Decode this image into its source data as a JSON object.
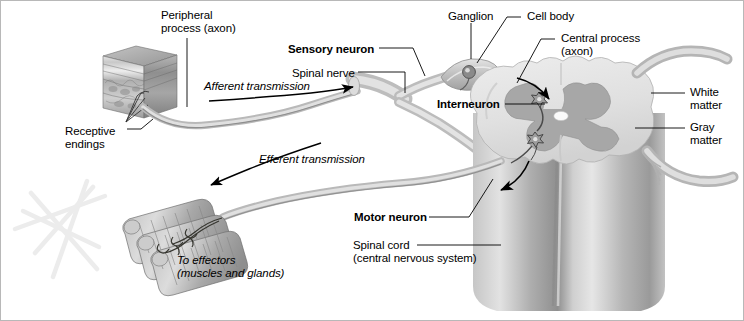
{
  "figure": {
    "background_color": "#ffffff",
    "border_color": "#b8b8b8",
    "width": 744,
    "height": 321
  },
  "palette": {
    "nerve_light": "#d8d8d8",
    "nerve_mid": "#b4b4b4",
    "nerve_dark": "#8f8f8f",
    "white_matter": "#e3e3e3",
    "gray_matter": "#a9a9a9",
    "cord_body_light": "#d4d4d4",
    "cord_body_dark": "#9b9b9b",
    "skin_block": "#9a9a9a",
    "muscle": "#a6a6a6",
    "line": "#000000",
    "watermark": "#ececec"
  },
  "labels": [
    {
      "id": "peripheral-process",
      "text": "Peripheral\nprocess (axon)",
      "bold": false,
      "italic": false,
      "x": 160,
      "y": 8,
      "align": "left"
    },
    {
      "id": "sensory-neuron",
      "text": "Sensory neuron",
      "bold": true,
      "italic": false,
      "x": 287,
      "y": 42,
      "align": "left"
    },
    {
      "id": "spinal-nerve",
      "text": "Spinal nerve",
      "bold": false,
      "italic": false,
      "x": 291,
      "y": 66,
      "align": "left"
    },
    {
      "id": "afferent-transmission",
      "text": "Afferent transmission",
      "bold": false,
      "italic": true,
      "x": 203,
      "y": 79,
      "align": "left"
    },
    {
      "id": "receptive-endings",
      "text": "Receptive\nendings",
      "bold": false,
      "italic": false,
      "x": 64,
      "y": 124,
      "align": "left"
    },
    {
      "id": "ganglion",
      "text": "Ganglion",
      "bold": false,
      "italic": false,
      "x": 447,
      "y": 9,
      "align": "left"
    },
    {
      "id": "cell-body",
      "text": "Cell body",
      "bold": false,
      "italic": false,
      "x": 526,
      "y": 9,
      "align": "left"
    },
    {
      "id": "central-process",
      "text": "Central process\n(axon)",
      "bold": false,
      "italic": false,
      "x": 560,
      "y": 31,
      "align": "left"
    },
    {
      "id": "interneuron",
      "text": "Interneuron",
      "bold": true,
      "italic": false,
      "x": 436,
      "y": 98,
      "align": "left"
    },
    {
      "id": "white-matter",
      "text": "White\nmatter",
      "bold": false,
      "italic": false,
      "x": 689,
      "y": 85,
      "align": "left"
    },
    {
      "id": "gray-matter",
      "text": "Gray\nmatter",
      "bold": false,
      "italic": false,
      "x": 689,
      "y": 120,
      "align": "left"
    },
    {
      "id": "efferent-transmission",
      "text": "Efferent transmission",
      "bold": false,
      "italic": true,
      "x": 258,
      "y": 152,
      "align": "left"
    },
    {
      "id": "motor-neuron",
      "text": "Motor neuron",
      "bold": true,
      "italic": false,
      "x": 353,
      "y": 211,
      "align": "left"
    },
    {
      "id": "spinal-cord",
      "text": "Spinal cord\n(central nervous system)",
      "bold": false,
      "italic": false,
      "x": 352,
      "y": 238,
      "align": "left"
    },
    {
      "id": "to-effectors",
      "text": "To effectors\n(muscles and glands)",
      "bold": false,
      "italic": true,
      "x": 176,
      "y": 253,
      "align": "left"
    }
  ],
  "structures": {
    "skin_block": "3D cube of skin tissue with epidermis, dermis and hypodermis layers",
    "receptive_endings": "branched sensory nerve endings in the dermis",
    "spinal_nerve": "mixed nerve trunk branching into dorsal and ventral roots",
    "ganglion": "dorsal root ganglion swelling containing the sensory cell body",
    "cell_body": "unipolar sensory neuron soma inside the ganglion",
    "spinal_cord": "cylindrical cord with butterfly-shaped gray matter and surrounding white matter",
    "central_canal": "small white oval at the center of the gray matter commissure",
    "interneuron": "two star-shaped neurons in the dorsal horn linked by a process",
    "motor_neuron": "neuron in the ventral horn projecting through the ventral root",
    "effector_muscle": "bundle of striated skeletal muscle fibers with motor end plates",
    "lateral_roots": "two nerve roots exiting the right side of the cord",
    "watermark": "faint pale star-shaped scribble in the lower left background"
  },
  "flow": {
    "afferent_direction": "toward the spinal cord",
    "efferent_direction": "away from the spinal cord toward the effectors",
    "cord_inbound_arrow": "arrow curving into the dorsal horn",
    "cord_outbound_arrow": "arrow curving out of the ventral horn"
  }
}
